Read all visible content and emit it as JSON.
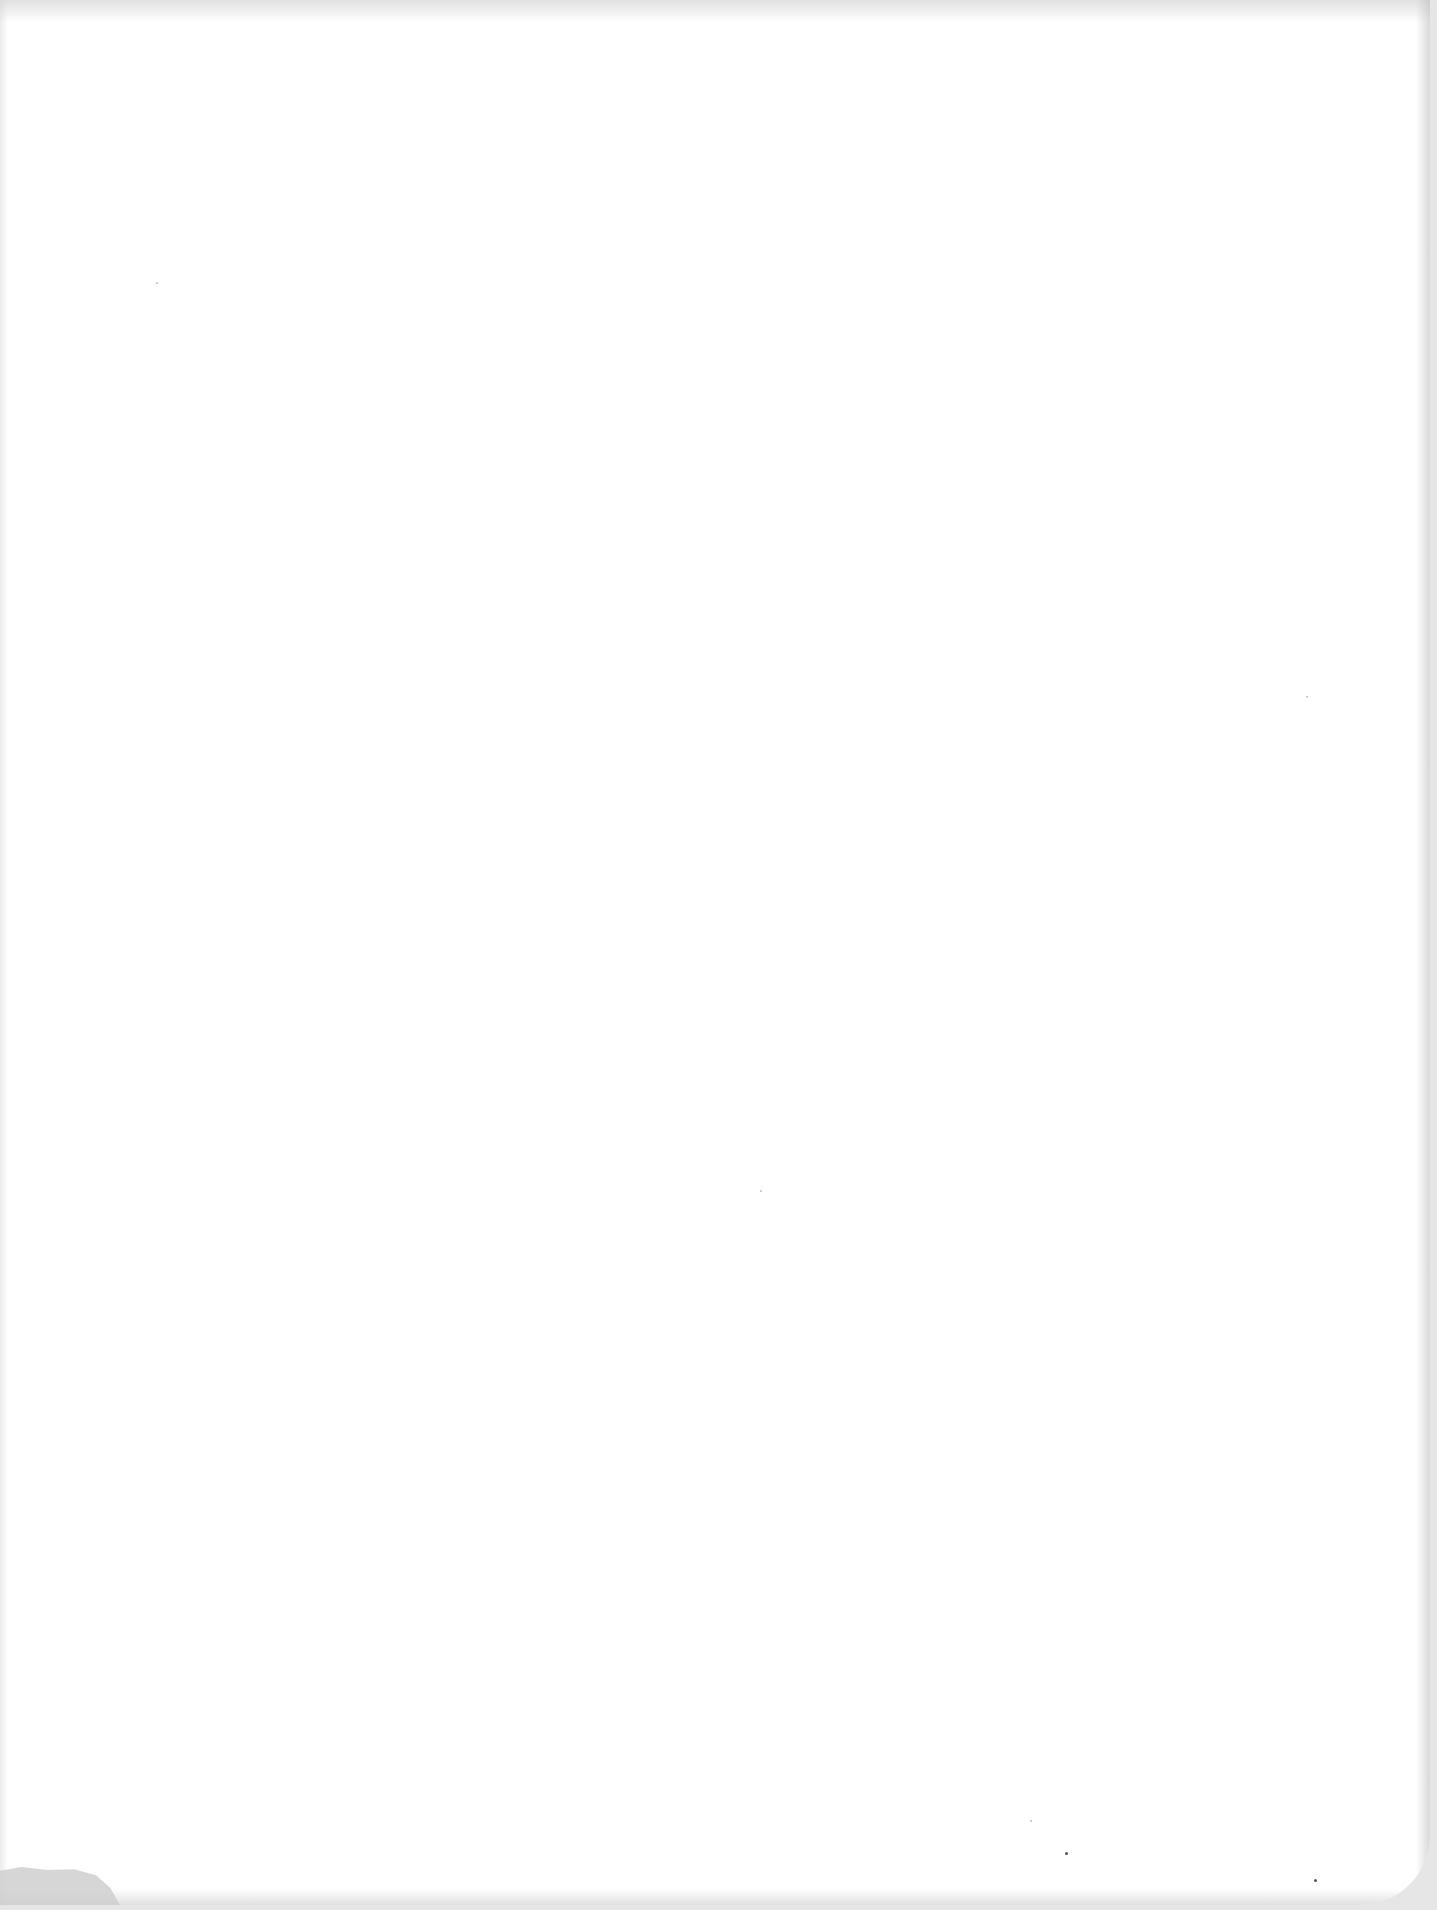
{
  "document": {
    "type": "blank scanned page",
    "text_content": "",
    "colors": {
      "paper": "#ffffff",
      "scan_background": "#e6e6e6",
      "edge_shadow": "#c8c8c8",
      "corner_curl": "#cfcfcf"
    }
  }
}
